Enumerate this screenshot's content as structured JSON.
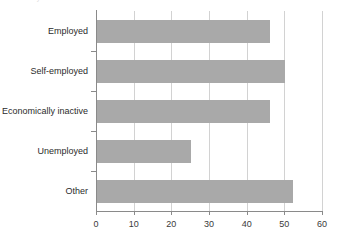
{
  "clipped_top_text": "......y",
  "chart_data": {
    "type": "bar",
    "orientation": "horizontal",
    "title": "",
    "subtitle": "",
    "xlabel": "",
    "ylabel": "",
    "categories": [
      "Employed",
      "Self-employed",
      "Economically inactive",
      "Unemployed",
      "Other"
    ],
    "values": [
      46,
      50,
      46,
      25,
      52
    ],
    "series": [
      {
        "name": "",
        "values": [
          46,
          50,
          46,
          25,
          52
        ]
      }
    ],
    "xlim": [
      0,
      60
    ],
    "xticks": [
      0,
      10,
      20,
      30,
      40,
      50,
      60
    ],
    "xtick_labels": [
      "0",
      "10",
      "20",
      "30",
      "40",
      "50",
      "60"
    ],
    "grid": "vertical",
    "legend": "none",
    "bar_color": "#a9a9a9",
    "gridline_color": "#d2d2d2",
    "axis_color": "#8a8a8a",
    "text_color": "#2b2b2b"
  }
}
